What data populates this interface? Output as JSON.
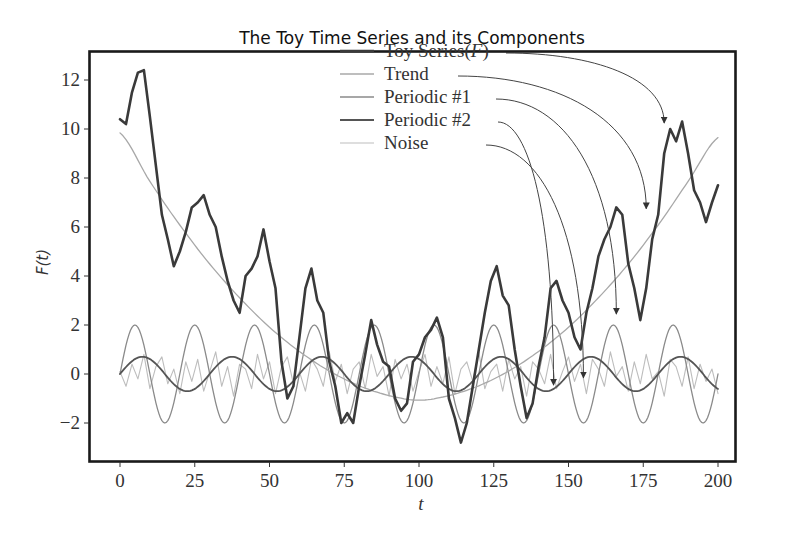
{
  "chart_data": {
    "type": "line",
    "title": "The Toy Time Series and its Components",
    "xlabel": "t",
    "ylabel": "F(t)",
    "xlim": [
      -8,
      208
    ],
    "ylim": [
      -3.5,
      13.2
    ],
    "xticks": [
      0,
      25,
      50,
      75,
      100,
      125,
      150,
      175,
      200
    ],
    "xtick_labels": [
      "0",
      "25",
      "50",
      "75",
      "100",
      "125",
      "150",
      "175",
      "200"
    ],
    "yticks": [
      -2,
      0,
      2,
      4,
      6,
      8,
      10,
      12
    ],
    "ytick_labels": [
      "-2",
      "0",
      "2",
      "4",
      "6",
      "8",
      "10",
      "12"
    ],
    "grid": false,
    "legend_position": "upper center",
    "legend": [
      {
        "name": "Toy Series(F)",
        "label_main": "Toy Series(",
        "label_italic": "F",
        "label_tail": ")",
        "color": "#3a3a3a",
        "width": 2.6
      },
      {
        "name": "Trend",
        "label_main": "Trend",
        "label_italic": "",
        "label_tail": "",
        "color": "#a8a8a8",
        "width": 1.3
      },
      {
        "name": "Periodic #1",
        "label_main": "Periodic #1",
        "label_italic": "",
        "label_tail": "",
        "color": "#8a8a8a",
        "width": 1.3
      },
      {
        "name": "Periodic #2",
        "label_main": "Periodic #2",
        "label_italic": "",
        "label_tail": "",
        "color": "#555555",
        "width": 1.8
      },
      {
        "name": "Noise",
        "label_main": "Noise",
        "label_italic": "",
        "label_tail": "",
        "color": "#bdbdbd",
        "width": 1.1
      }
    ],
    "series": [
      {
        "name": "Toy Series(F)",
        "x_start": 0,
        "x_step": 2,
        "values": [
          10.4,
          10.2,
          11.5,
          12.3,
          12.4,
          10.5,
          8.5,
          6.5,
          5.5,
          4.4,
          5.0,
          5.8,
          6.8,
          7.0,
          7.3,
          6.5,
          6.0,
          4.8,
          3.8,
          3.0,
          2.5,
          4.0,
          4.3,
          4.8,
          5.9,
          4.6,
          3.5,
          0.5,
          -1.0,
          -0.5,
          1.5,
          3.5,
          4.3,
          3.0,
          2.5,
          0.5,
          -0.5,
          -2.0,
          -1.6,
          -2.0,
          -0.5,
          0.8,
          2.2,
          1.2,
          0.5,
          0.3,
          -1.0,
          -1.5,
          -1.2,
          0.5,
          0.8,
          1.5,
          1.8,
          2.3,
          1.5,
          -1.0,
          -1.8,
          -2.8,
          -2.0,
          -0.5,
          1.0,
          2.5,
          3.8,
          4.4,
          3.2,
          2.8,
          1.0,
          -0.5,
          -1.8,
          -1.2,
          0.3,
          1.5,
          3.5,
          3.8,
          3.0,
          2.5,
          1.5,
          1.0,
          2.5,
          3.5,
          4.8,
          5.5,
          6.0,
          6.8,
          6.5,
          4.5,
          3.5,
          2.2,
          3.5,
          5.5,
          6.5,
          9.0,
          10.0,
          9.5,
          10.3,
          9.0,
          7.5,
          7.0,
          6.2,
          7.0,
          7.7
        ]
      },
      {
        "name": "Trend",
        "x_start": 0,
        "x_step": 10,
        "values": [
          9.84,
          7.86,
          6.08,
          4.49,
          3.11,
          1.91,
          0.92,
          0.12,
          -0.48,
          -0.88,
          -1.07,
          -0.88,
          -0.48,
          0.12,
          0.92,
          1.91,
          3.11,
          4.49,
          6.08,
          7.86,
          9.65
        ],
        "note_formula_shape": "parabola, minimum ~0 near t=100"
      },
      {
        "name": "Periodic #1",
        "amplitude": 2.0,
        "period": 20,
        "phase": 0
      },
      {
        "name": "Periodic #2",
        "amplitude": 0.7,
        "period": 30,
        "phase": 0
      },
      {
        "name": "Noise",
        "x_start": 0,
        "x_step": 2,
        "values": [
          0.1,
          -0.5,
          0.4,
          -0.2,
          0.8,
          -0.6,
          0.3,
          0.7,
          -0.4,
          0.2,
          -0.8,
          0.5,
          -0.3,
          0.6,
          -0.7,
          0.1,
          0.9,
          -0.5,
          0.3,
          -0.9,
          0.4,
          0.2,
          -0.6,
          0.8,
          -0.2,
          0.5,
          -0.8,
          0.3,
          0.7,
          -0.4,
          0.1,
          -0.7,
          0.6,
          0.2,
          -0.5,
          0.9,
          -0.3,
          0.4,
          -0.8,
          0.2,
          0.5,
          -0.6,
          0.8,
          -0.1,
          0.3,
          -0.9,
          0.6,
          -0.2,
          0.4,
          -0.7,
          0.1,
          0.8,
          -0.5,
          0.3,
          -0.4,
          0.7,
          -0.8,
          0.2,
          0.5,
          -0.3,
          0.9,
          -0.6,
          0.1,
          0.4,
          -0.7,
          0.6,
          -0.2,
          0.3,
          -0.9,
          0.5,
          0.2,
          -0.4,
          0.8,
          -0.6,
          0.1,
          0.7,
          -0.3,
          0.4,
          -0.8,
          0.6,
          0.2,
          -0.5,
          0.9,
          -0.1,
          0.3,
          -0.7,
          0.5,
          -0.4,
          0.8,
          -0.2,
          0.1,
          -0.9,
          0.6,
          0.3,
          -0.5,
          0.7,
          -0.6,
          0.4,
          -0.3,
          0.2,
          -0.8
        ]
      }
    ],
    "annotations": [
      {
        "from_legend": "Toy Series(F)",
        "to_t": 182,
        "to_F": 10.0
      },
      {
        "from_legend": "Trend",
        "to_t": 176,
        "to_F": 6.5
      },
      {
        "from_legend": "Periodic #1",
        "to_t": 166,
        "to_F": 2.2
      },
      {
        "from_legend": "Periodic #2",
        "to_t": 145,
        "to_F": -0.7
      },
      {
        "from_legend": "Noise",
        "to_t": 155,
        "to_F": -0.4
      }
    ]
  }
}
